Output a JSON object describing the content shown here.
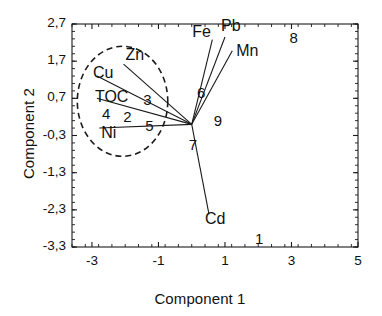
{
  "chart_data": {
    "type": "scatter",
    "title": "",
    "xlabel": "Component 1",
    "ylabel": "Component 2",
    "xlim": [
      -3.6,
      5.0
    ],
    "ylim": [
      -3.3,
      2.7
    ],
    "grid": false,
    "legend": null,
    "xticks": [
      "-3",
      "-1",
      "1",
      "3",
      "5"
    ],
    "xtick_values": [
      -3,
      -1,
      1,
      3,
      5
    ],
    "yticks": [
      "2,7",
      "1,7",
      "0,7",
      "-0,3",
      "-1,3",
      "-2,3",
      "-3,3"
    ],
    "ytick_values": [
      2.7,
      1.7,
      0.7,
      -0.3,
      -1.3,
      -2.3,
      -3.3
    ],
    "origin": [
      0,
      0
    ],
    "loadings": [
      {
        "name": "Zn",
        "label": "Zn",
        "x": -2.05,
        "y": 1.62,
        "tip_x": -2.05,
        "tip_y": 1.62
      },
      {
        "name": "Cu",
        "label": "Cu",
        "x": -2.85,
        "y": 1.3,
        "tip_x": -2.85,
        "tip_y": 1.3
      },
      {
        "name": "TOC",
        "label": "TOC",
        "x": -2.85,
        "y": 0.7,
        "tip_x": -2.85,
        "tip_y": 0.7
      },
      {
        "name": "Ni",
        "label": "Ni",
        "x": -2.78,
        "y": -0.1,
        "tip_x": -2.78,
        "tip_y": -0.1
      },
      {
        "name": "Fe",
        "label": "Fe",
        "x": 0.62,
        "y": 2.28,
        "tip_x": 0.62,
        "tip_y": 2.28
      },
      {
        "name": "Pb",
        "label": "Pb",
        "x": 1.0,
        "y": 2.35,
        "tip_x": 1.0,
        "tip_y": 2.35
      },
      {
        "name": "Mn",
        "label": "Mn",
        "x": 1.22,
        "y": 1.98,
        "tip_x": 1.22,
        "tip_y": 1.98
      },
      {
        "name": "Cd",
        "label": "Cd",
        "x": 0.52,
        "y": -2.42,
        "tip_x": 0.52,
        "tip_y": -2.42
      }
    ],
    "scores": [
      {
        "label": "1",
        "x": 2.02,
        "y": -3.12
      },
      {
        "label": "2",
        "x": -1.94,
        "y": 0.18
      },
      {
        "label": "3",
        "x": -1.34,
        "y": 0.62
      },
      {
        "label": "4",
        "x": -2.58,
        "y": 0.24
      },
      {
        "label": "5",
        "x": -1.28,
        "y": -0.06
      },
      {
        "label": "6",
        "x": 0.28,
        "y": 0.82
      },
      {
        "label": "7",
        "x": 0.03,
        "y": -0.58
      },
      {
        "label": "8",
        "x": 3.06,
        "y": 2.3
      },
      {
        "label": "9",
        "x": 0.78,
        "y": 0.06
      }
    ],
    "ellipse": {
      "center_x": -2.08,
      "center_y": 0.62,
      "radius_x": 1.36,
      "radius_y": 1.48,
      "style": "dashed"
    }
  },
  "style": {
    "line_color": "#1a1a1a",
    "text_color": "#111111",
    "background": "#ffffff"
  }
}
